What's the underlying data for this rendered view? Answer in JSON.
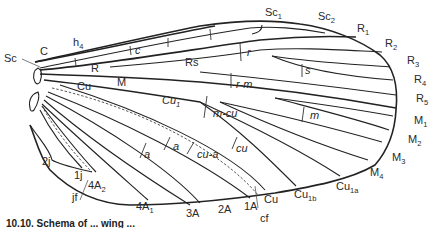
{
  "figure": {
    "caption_fragment": "10.10. Schema of ... wing ..."
  },
  "labels": {
    "costa": "C",
    "subcosta": "Sc",
    "humeral": "h",
    "humeral_sub": "4",
    "crossvein_c": "c",
    "sc1": "Sc",
    "sc1_sub": "1",
    "sc2": "Sc",
    "sc2_sub": "2",
    "radius": "R",
    "r1": "R",
    "r1_sub": "1",
    "r2": "R",
    "r2_sub": "2",
    "r3": "R",
    "r3_sub": "3",
    "r4": "R",
    "r4_sub": "4",
    "r5": "R",
    "r5_sub": "5",
    "radial_sector": "Rs",
    "crossvein_r": "r",
    "crossvein_s": "s",
    "crossvein_rm": "r-m",
    "media": "M",
    "m1": "M",
    "m1_sub": "1",
    "m2": "M",
    "m2_sub": "2",
    "m3": "M",
    "m3_sub": "3",
    "m4": "M",
    "m4_sub": "4",
    "crossvein_m": "m",
    "crossvein_mcu": "m-cu",
    "cubitus": "Cu",
    "cu1": "Cu",
    "cu1_sub": "1",
    "cu1a": "Cu",
    "cu1a_sub": "1a",
    "cu1b": "Cu",
    "cu1b_sub": "1b",
    "cu_margin": "Cu",
    "crossvein_cu": "cu",
    "crossvein_cua": "cu-a",
    "crossvein_a1": "a",
    "crossvein_a2": "a",
    "a1": "1A",
    "a2": "2A",
    "a3": "3A",
    "a4_1": "4A",
    "a4_1_sub": "1",
    "a4_2": "4A",
    "a4_2_sub": "2",
    "jugal_1": "1j",
    "jugal_2": "2j",
    "jugal_fold": "jf",
    "claval_furrow": "cf"
  }
}
